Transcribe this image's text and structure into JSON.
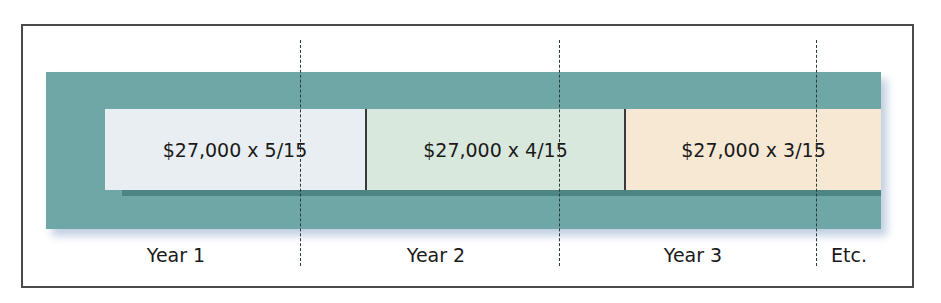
{
  "diagram": {
    "type": "sum-of-years-digits-depreciation-timeline",
    "segments": [
      {
        "label": "$27,000 x 5/15",
        "year": "Year 1",
        "fill": "#e8eef1"
      },
      {
        "label": "$27,000 x 4/15",
        "year": "Year 2",
        "fill": "#d9e8dd"
      },
      {
        "label": "$27,000 x 3/15",
        "year": "Year 3",
        "fill": "#f6e8d3"
      }
    ],
    "continuation_label": "Etc.",
    "colors": {
      "band": "#6ea7a6",
      "band_shadow_strip": "#4d8584",
      "frame_border": "#4a4a4a",
      "divider_lines": "#2a3a3a"
    }
  }
}
